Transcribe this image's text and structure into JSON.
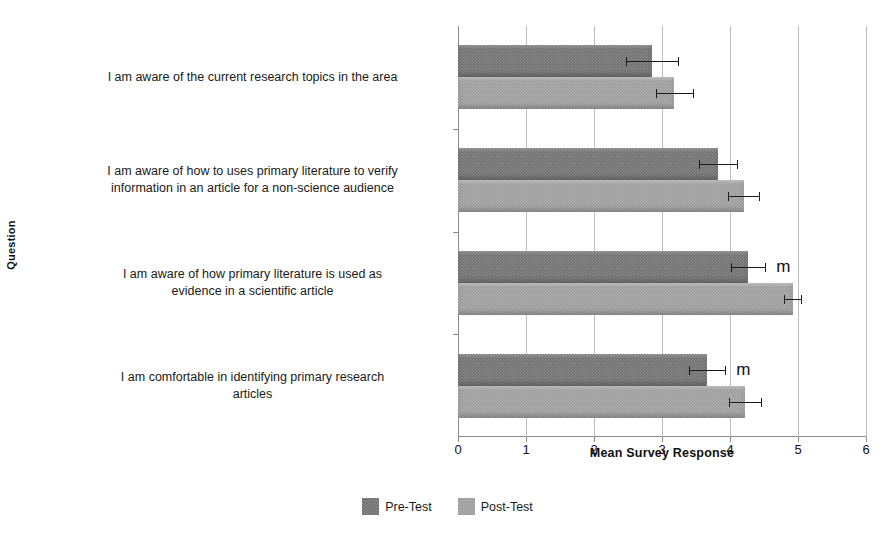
{
  "chart_data": {
    "type": "bar",
    "orientation": "horizontal",
    "title": "",
    "xlabel": "Mean Survey Response",
    "ylabel": "Question",
    "xlim": [
      0,
      6
    ],
    "ylim": null,
    "grid": true,
    "legend_position": "bottom-center",
    "xticks": [
      "0",
      "1",
      "2",
      "3",
      "4",
      "5",
      "6"
    ],
    "categories": [
      "I am aware of the current research topics in the area",
      "I am aware of how to uses primary literature to verify information in an article for a non-science audience",
      "I am aware of how primary literature is used as evidence in a scientific article",
      "I am comfortable in identifying primary research articles"
    ],
    "series": [
      {
        "name": "Pre-Test",
        "color": "#6f6f6f",
        "values": [
          2.85,
          3.83,
          4.27,
          3.66
        ],
        "errors": [
          0.38,
          0.28,
          0.25,
          0.27
        ]
      },
      {
        "name": "Post-Test",
        "color": "#9b9b9b",
        "values": [
          3.18,
          4.2,
          4.92,
          4.22
        ],
        "errors": [
          0.27,
          0.23,
          0.13,
          0.24
        ]
      }
    ],
    "annotations": [
      {
        "text": "m",
        "category_index": 2,
        "series": "Pre-Test"
      },
      {
        "text": "m",
        "category_index": 3,
        "series": "Pre-Test"
      }
    ]
  },
  "axes": {
    "x_title": "Mean Survey Response",
    "y_title": "Question",
    "x_tick_labels": [
      "0",
      "1",
      "2",
      "3",
      "4",
      "5",
      "6"
    ]
  },
  "legend": {
    "items": [
      {
        "label": "Pre-Test",
        "swatch": "pre"
      },
      {
        "label": "Post-Test",
        "swatch": "post"
      }
    ]
  },
  "category_labels": [
    {
      "lines": [
        "I am aware of the current research topics in the area"
      ]
    },
    {
      "lines": [
        "I am aware of how to uses primary literature to verify",
        "information in an article for a non-science audience"
      ]
    },
    {
      "lines": [
        "I am aware of how primary literature is used as",
        "evidence in a scientific article"
      ]
    },
    {
      "lines": [
        "I am comfortable in identifying primary research",
        "articles"
      ]
    }
  ],
  "markers": {
    "significance": "m"
  }
}
